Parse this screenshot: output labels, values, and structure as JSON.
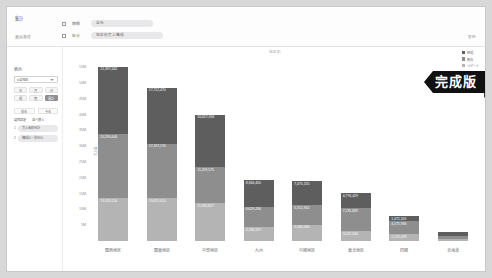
{
  "toolbar": {
    "title": "集計",
    "subtitle": "表示条件",
    "rows": [
      {
        "label": "期間",
        "value": "全社"
      },
      {
        "label": "区分",
        "value": "地区別売上構成"
      }
    ],
    "right_note": "更新"
  },
  "sidepanel": {
    "title": "表示",
    "select_value": "全地区",
    "buttons": [
      "年",
      "月",
      "日",
      "週",
      "期",
      "累計"
    ],
    "sub_buttons": [
      "前年",
      "今年"
    ],
    "field_labels": [
      "項目設定",
      "並べ替え"
    ],
    "fields": [
      {
        "num": "1",
        "value": "売上金額合計"
      },
      {
        "num": "2",
        "value": "構成比・前年比"
      }
    ]
  },
  "chart": {
    "title": "地区別"
  },
  "legend": {
    "position": "top-right",
    "items": [
      {
        "label": "新規",
        "color": "#5e5e5e"
      },
      {
        "label": "既存",
        "color": "#8e8e8e"
      },
      {
        "label": "リピート",
        "color": "#b4b4b4"
      }
    ]
  },
  "badge": {
    "label": "完成版"
  },
  "chart_data": {
    "type": "bar",
    "stacked": true,
    "title": "地区別",
    "xlabel": "",
    "ylabel": "売上高",
    "ylim": [
      0,
      57000000
    ],
    "grid": false,
    "legend_position": "top-right",
    "ytick_labels": [
      "55M",
      "50M",
      "45M",
      "40M",
      "35M",
      "30M",
      "25M",
      "20M",
      "15M",
      "10M",
      "5M"
    ],
    "ytick_values": [
      55000000,
      50000000,
      45000000,
      40000000,
      35000000,
      30000000,
      25000000,
      20000000,
      15000000,
      10000000,
      5000000
    ],
    "categories": [
      "関西地区",
      "関東地区",
      "中部地区",
      "九州",
      "中國地区",
      "東北地区",
      "四國",
      "北海道"
    ],
    "series": [
      {
        "name": "新規",
        "color": "#5e5e5e",
        "values": [
          21397442,
          17712470,
          16627394,
          8364450,
          7475155,
          4776429,
          1472105,
          1300000
        ],
        "labels": [
          "21,397,442",
          "17,712,470",
          "16,627,394",
          "8,364,450",
          "7,475,155",
          "4,776,429",
          "1,472,105",
          ""
        ]
      },
      {
        "name": "既存",
        "color": "#8e8e8e",
        "values": [
          20295646,
          17197170,
          11299575,
          6629236,
          6312944,
          7235839,
          4175936,
          900000
        ],
        "labels": [
          "20,295,646",
          "17,197,170",
          "11,299,575",
          "6,629,236",
          "6,312,944",
          "7,235,839",
          "4,175,936",
          ""
        ]
      },
      {
        "name": "リピート",
        "color": "#b4b4b4",
        "values": [
          13559214,
          13615014,
          11985827,
          4286597,
          5080586,
          3072044,
          2123078,
          600000
        ],
        "labels": [
          "13,559,214",
          "13,615,014",
          "11,985,827",
          "4,286,597",
          "5,080,586",
          "3,072,044",
          "2,123,078",
          ""
        ]
      }
    ]
  }
}
